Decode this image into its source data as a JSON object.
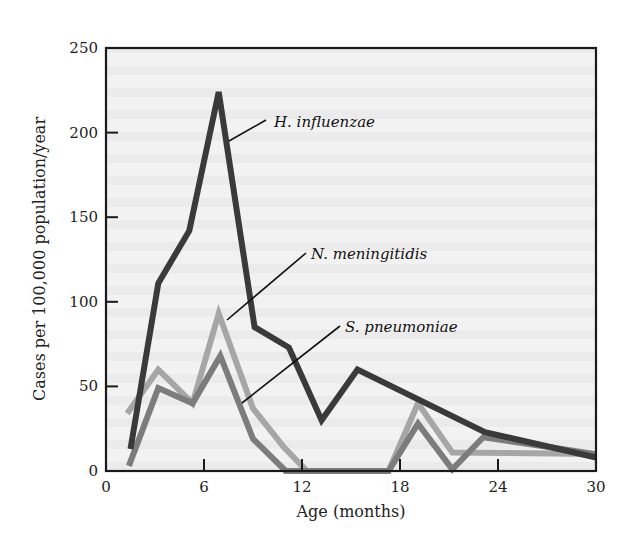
{
  "chart_data": {
    "type": "line",
    "title": "",
    "xlabel": "Age (months)",
    "ylabel": "Cases per 100,000 population/year",
    "xlim": [
      0,
      30
    ],
    "ylim": [
      0,
      250
    ],
    "xticks": [
      0,
      6,
      12,
      18,
      24,
      30
    ],
    "yticks": [
      0,
      50,
      100,
      150,
      200,
      250
    ],
    "grid": false,
    "legend": "inline labels with leader lines",
    "series": [
      {
        "name": "H. influenzae",
        "color": "#3a3a3a",
        "points": [
          [
            1.5,
            13
          ],
          [
            3.2,
            111
          ],
          [
            5.1,
            142
          ],
          [
            6.9,
            224
          ],
          [
            9.1,
            85
          ],
          [
            11.2,
            73
          ],
          [
            13.2,
            30
          ],
          [
            15.4,
            60
          ],
          [
            23.2,
            23
          ],
          [
            30,
            8
          ]
        ]
      },
      {
        "name": "N. meningitidis",
        "color": "#a6a6a6",
        "points": [
          [
            1.3,
            34
          ],
          [
            3.2,
            60
          ],
          [
            5.3,
            40
          ],
          [
            6.9,
            93
          ],
          [
            9.0,
            37
          ],
          [
            10.9,
            14
          ],
          [
            12.3,
            0
          ],
          [
            17.3,
            0
          ],
          [
            19.1,
            40
          ],
          [
            21.2,
            11
          ],
          [
            30,
            10
          ]
        ]
      },
      {
        "name": "S. pneumoniae",
        "color": "#7c7c7c",
        "points": [
          [
            1.4,
            3
          ],
          [
            3.2,
            49
          ],
          [
            5.3,
            40
          ],
          [
            7.0,
            68
          ],
          [
            9.0,
            19
          ],
          [
            11.0,
            0
          ],
          [
            17.3,
            0
          ],
          [
            19.1,
            28
          ],
          [
            21.2,
            1
          ],
          [
            23.1,
            20
          ],
          [
            30,
            10
          ]
        ]
      }
    ],
    "annotations": [
      {
        "text": "H. influenzae",
        "series": "H. influenzae"
      },
      {
        "text": "N. meningitidis",
        "series": "N. meningitidis"
      },
      {
        "text": "S. pneumoniae",
        "series": "S. pneumoniae"
      }
    ]
  },
  "labels": {
    "xlabel": "Age (months)",
    "ylabel": "Cases per 100,000 population/year",
    "series_h": "H. influenzae",
    "series_n": "N. meningitidis",
    "series_s": "S. pneumoniae"
  }
}
